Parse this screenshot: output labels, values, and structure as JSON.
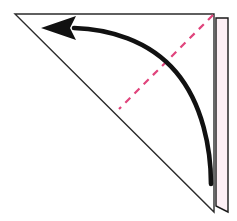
{
  "document": {
    "title": "Origami fold step diagram",
    "background_color": "#ffffff",
    "width": 237,
    "height": 221,
    "caption": "Fold the right flap over to the left along the dashed crease line."
  },
  "palette": {
    "paper_fill": "#ffffff",
    "paper_edge": "#2b2b2b",
    "paper_edge_soft": "#555555",
    "crease_dash": "#e0447c",
    "flap_fill": "#fdf0f5",
    "flap_edge": "#1a1a1a",
    "arrow_color": "#111111"
  },
  "shapes": {
    "main_sheet": {
      "name": "triangular-paper-sheet",
      "label": "Folded paper triangle",
      "points": "15,14 214,14 214,212",
      "fill": "#ffffff",
      "stroke": "#2b2b2b",
      "stroke_width": 1.4
    },
    "flap": {
      "name": "right-edge-flap",
      "label": "Thin vertical flap on right edge",
      "points": "216,18 228,18 228,212 216,206",
      "fill": "#fdf0f5",
      "stroke": "#1a1a1a",
      "stroke_width": 1.4
    },
    "crease": {
      "name": "dashed-crease-line",
      "label": "Dashed fold crease",
      "x1": 213,
      "y1": 15,
      "x2": 119,
      "y2": 109,
      "stroke": "#e0447c",
      "stroke_width": 2.2,
      "dash_pattern": "7 6"
    },
    "arrow": {
      "name": "fold-direction-arrow",
      "label": "Curved fold direction arrow",
      "path": "M 211,184 C 211,150 203,104 176,72 C 149,40 108,29 74,28",
      "stroke": "#111111",
      "stroke_width": 4.6,
      "head_points": "41,28 76,16 70,28 76,40",
      "head_fill": "#111111"
    }
  },
  "annotations": {
    "crease_label": "fold line",
    "arrow_label": "fold direction",
    "sheet_label": "paper",
    "flap_label": "flap"
  }
}
